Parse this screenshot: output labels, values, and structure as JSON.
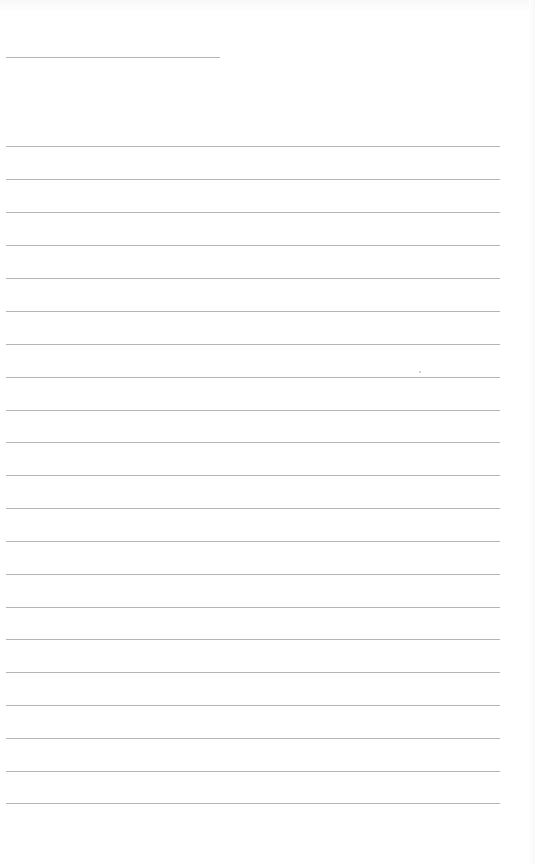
{
  "document": {
    "type": "lined-page",
    "header_line": {
      "y": 57,
      "x_start": 6,
      "x_end": 220
    },
    "rules": [
      146,
      179,
      212,
      245,
      278,
      311,
      344,
      377,
      410,
      442,
      475,
      508,
      541,
      574,
      607,
      639,
      672,
      705,
      738,
      771,
      803
    ],
    "rule_x_start": 6,
    "rule_x_end": 500,
    "rule_color": "#b4b4b4",
    "background_color": "#ffffff",
    "text": ""
  }
}
